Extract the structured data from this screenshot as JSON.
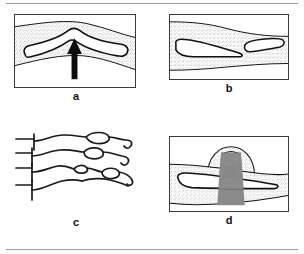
{
  "figure": {
    "background_color": "#ffffff",
    "rule_color": "#9a9a9a",
    "panel_border_color": "#3a3a3a",
    "stipple_color": "#4a4a4a",
    "outline_color": "#111111",
    "gray_fill_color": "#8a8a8a",
    "dark_fill_color": "#1a1a1a",
    "lumen_fill_color": "#ffffff"
  },
  "panels": [
    {
      "id": "a",
      "label": "a",
      "description": "Stippled tissue band with a chevron-shaped white lumen and an upward arrow pointing at the apex",
      "has_arrow": true,
      "arrow_direction": "up",
      "bordered": true
    },
    {
      "id": "b",
      "label": "b",
      "description": "Stippled tissue band containing two offset white lumen segments separated by a step",
      "has_arrow": false,
      "bordered": true
    },
    {
      "id": "c",
      "label": "c",
      "description": "Four wavy fiber lines with bracket stubs at left, bulbous nodules along their length, and hooked tails at right",
      "fiber_count": 4,
      "nodule_count": 4,
      "has_arrow": false,
      "bordered": false
    },
    {
      "id": "d",
      "label": "d",
      "description": "Stippled tissue band crossed by a gray vertical column with a stippled dome above containing a white oval and a dark filled oval",
      "has_arrow": false,
      "bordered": true
    }
  ]
}
